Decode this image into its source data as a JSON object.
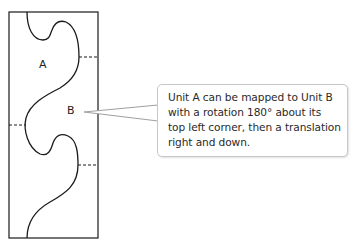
{
  "diagram": {
    "labels": {
      "unit_a": "A",
      "unit_b": "B"
    },
    "callout": {
      "lines": [
        "Unit A can be mapped to Unit B",
        "with a rotation 180° about its",
        "top left corner, then a translation",
        "right and down."
      ]
    },
    "colors": {
      "outline": "#1a1a1a",
      "callout_border": "#c8c8c8",
      "pointer": "#a0a0a0"
    }
  }
}
